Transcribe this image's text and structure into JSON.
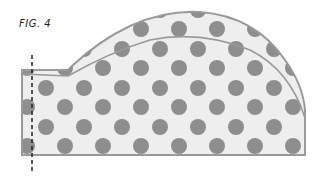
{
  "figure": {
    "label": "FIG. 4",
    "colors": {
      "fill": "#eeeeee",
      "dot": "#8e8e8e",
      "outline": "#9a9a9a",
      "fold_line": "#222222"
    },
    "annotations": {
      "fold_line": "dashed vertical line near left edge",
      "inner_line": "curved seam line inside the piece"
    }
  }
}
